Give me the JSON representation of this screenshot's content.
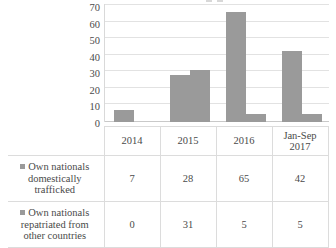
{
  "chart_data": {
    "type": "bar",
    "title": "",
    "xlabel": "",
    "ylabel": "",
    "categories": [
      "2014",
      "2015",
      "2016",
      "Jan-Sep 2017"
    ],
    "series": [
      {
        "name": "Own nationals domestically trafficked",
        "values": [
          7,
          28,
          65,
          42
        ],
        "color": "#9a9a9a"
      },
      {
        "name": "Own nationals repatriated from other countries",
        "values": [
          0,
          31,
          5,
          5
        ],
        "color": "#9a9a9a"
      }
    ],
    "ylim": [
      0,
      70
    ],
    "ytick_step": 10,
    "yticks": [
      "70",
      "60",
      "50",
      "40",
      "30",
      "20",
      "10",
      "0"
    ],
    "grid": true,
    "legend_position": "left-table",
    "data_table_visible": true
  },
  "top_clipped_legend": {
    "marker": "legend-swatch",
    "text": ""
  },
  "axis": {
    "y_labels": [
      "70",
      "60",
      "50",
      "40",
      "30",
      "20",
      "10",
      "0"
    ]
  },
  "table": {
    "header_blank": "",
    "columns": [
      "2014",
      "2015",
      "2016",
      "Jan-Sep 2017"
    ],
    "col_jansep_line1": "Jan-Sep",
    "col_jansep_line2": "2017",
    "rows": [
      {
        "label": "Own nationals domestically trafficked",
        "values": [
          "7",
          "28",
          "65",
          "42"
        ]
      },
      {
        "label": "Own nationals repatriated from other countries",
        "values": [
          "0",
          "31",
          "5",
          "5"
        ]
      }
    ]
  },
  "colors": {
    "bar": "#9a9a9a",
    "gridline": "#e2e2e2",
    "border": "#dcdcdc",
    "text": "#4a4a4a",
    "background": "#ffffff"
  }
}
